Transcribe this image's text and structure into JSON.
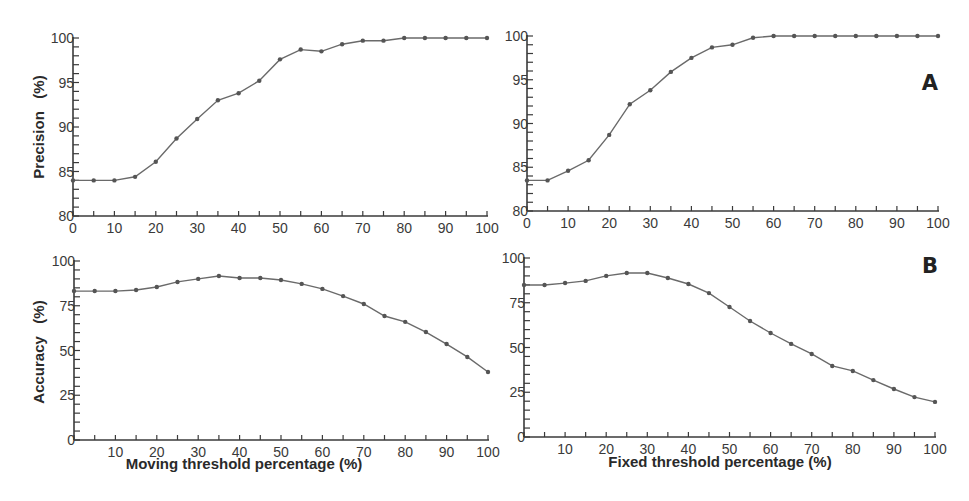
{
  "figure": {
    "panel_labels": [
      "A",
      "B"
    ],
    "colors": {
      "line": "#6a6a6a",
      "axis": "#3a3a3a",
      "marker": "#555555"
    }
  },
  "chart_data": [
    {
      "id": "top-left",
      "panel": "A",
      "type": "line",
      "title": "",
      "xlabel": "",
      "ylabel": "Precision   (%)",
      "xlim": [
        0,
        100
      ],
      "ylim": [
        80,
        100
      ],
      "xticks": [
        0,
        10,
        20,
        30,
        40,
        50,
        60,
        70,
        80,
        90,
        100
      ],
      "yticks": [
        80,
        85,
        90,
        95,
        100
      ],
      "grid": false,
      "x": [
        0,
        5,
        10,
        15,
        20,
        25,
        30,
        35,
        40,
        45,
        50,
        55,
        60,
        65,
        70,
        75,
        80,
        85,
        90,
        95,
        100
      ],
      "series": [
        {
          "name": "Precision (moving threshold)",
          "values": [
            84.0,
            84.0,
            84.0,
            84.4,
            86.1,
            88.7,
            90.9,
            93.0,
            93.8,
            95.2,
            97.6,
            98.7,
            98.5,
            99.3,
            99.7,
            99.7,
            100,
            100,
            100,
            100,
            100
          ]
        }
      ]
    },
    {
      "id": "top-right",
      "panel": "A",
      "type": "line",
      "title": "",
      "xlabel": "",
      "ylabel": "",
      "xlim": [
        0,
        100
      ],
      "ylim": [
        80,
        100
      ],
      "xticks": [
        0,
        10,
        20,
        30,
        40,
        50,
        60,
        70,
        80,
        90,
        100
      ],
      "yticks": [
        80,
        85,
        90,
        95,
        100
      ],
      "grid": false,
      "x": [
        0,
        5,
        10,
        15,
        20,
        25,
        30,
        35,
        40,
        45,
        50,
        55,
        60,
        65,
        70,
        75,
        80,
        85,
        90,
        95,
        100
      ],
      "series": [
        {
          "name": "Precision (fixed threshold)",
          "values": [
            83.5,
            83.5,
            84.6,
            85.8,
            88.7,
            92.2,
            93.8,
            95.9,
            97.5,
            98.7,
            99.0,
            99.8,
            100,
            100,
            100,
            100,
            100,
            100,
            100,
            100,
            100
          ]
        }
      ]
    },
    {
      "id": "bottom-left",
      "panel": "B",
      "type": "line",
      "title": "",
      "xlabel": "Moving threshold percentage (%)",
      "ylabel": "Accuracy   (%)",
      "xlim": [
        0,
        100
      ],
      "ylim": [
        0,
        100
      ],
      "xticks": [
        10,
        20,
        30,
        40,
        50,
        60,
        70,
        80,
        90,
        100
      ],
      "yticks": [
        0,
        25,
        50,
        75,
        100
      ],
      "grid": false,
      "x": [
        0,
        5,
        10,
        15,
        20,
        25,
        30,
        35,
        40,
        45,
        50,
        55,
        60,
        65,
        70,
        75,
        80,
        85,
        90,
        95,
        100
      ],
      "series": [
        {
          "name": "Accuracy (moving threshold)",
          "values": [
            83.2,
            83.2,
            83.2,
            83.8,
            85.5,
            88.3,
            90.0,
            91.6,
            90.5,
            90.5,
            89.4,
            87.2,
            84.4,
            80.4,
            76.0,
            69.3,
            66.0,
            60.3,
            53.6,
            46.4,
            38.0
          ]
        }
      ]
    },
    {
      "id": "bottom-right",
      "panel": "B",
      "type": "line",
      "title": "",
      "xlabel": "Fixed threshold percentage (%)",
      "ylabel": "",
      "xlim": [
        0,
        100
      ],
      "ylim": [
        0,
        100
      ],
      "xticks": [
        10,
        20,
        30,
        40,
        50,
        60,
        70,
        80,
        90,
        100
      ],
      "yticks": [
        0,
        25,
        50,
        75,
        100
      ],
      "grid": false,
      "x": [
        0,
        5,
        10,
        15,
        20,
        25,
        30,
        35,
        40,
        45,
        50,
        55,
        60,
        65,
        70,
        75,
        80,
        85,
        90,
        95,
        100
      ],
      "series": [
        {
          "name": "Accuracy (fixed threshold)",
          "values": [
            84.9,
            84.9,
            86.0,
            87.2,
            90.0,
            91.6,
            91.6,
            88.8,
            85.5,
            80.4,
            72.6,
            64.8,
            58.1,
            52.0,
            46.4,
            39.7,
            36.9,
            31.8,
            26.8,
            22.3,
            19.6
          ]
        }
      ]
    }
  ]
}
